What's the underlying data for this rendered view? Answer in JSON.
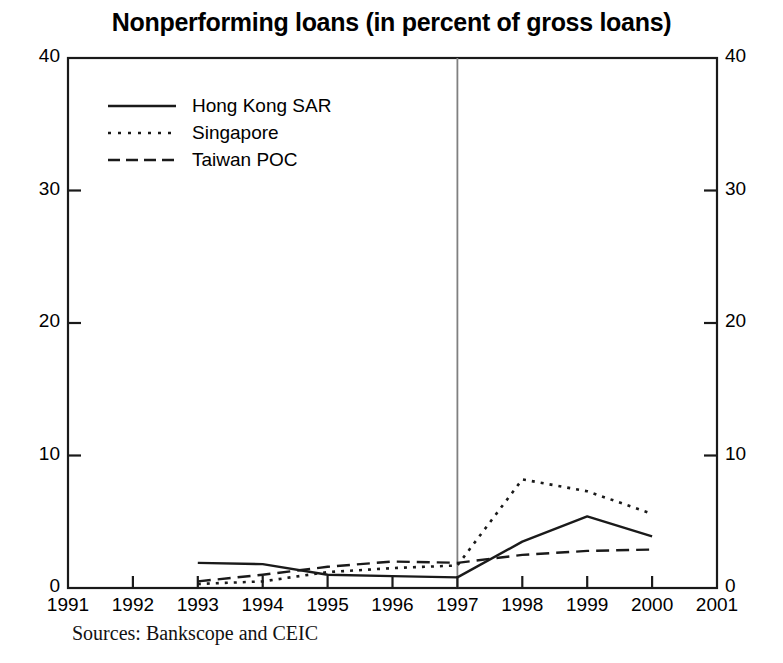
{
  "chart_data": {
    "type": "line",
    "title": "Nonperforming loans (in percent of gross loans)",
    "xlabel": "",
    "ylabel": "",
    "xlim": [
      1991,
      2001
    ],
    "ylim": [
      0,
      40
    ],
    "grid": false,
    "legend_position": "top-left",
    "x_tick_labels": [
      "1991",
      "1992",
      "1993",
      "1994",
      "1995",
      "1996",
      "1997",
      "1998",
      "1999",
      "2000",
      "2001"
    ],
    "y_tick_labels_left": [
      "0",
      "10",
      "20",
      "30",
      "40"
    ],
    "y_tick_labels_right": [
      "0",
      "10",
      "20",
      "30",
      "40"
    ],
    "y_ticks": [
      0,
      10,
      20,
      30,
      40
    ],
    "x": [
      1993,
      1994,
      1995,
      1996,
      1997,
      1998,
      1999,
      2000
    ],
    "annotations": [
      {
        "name": "crisis-divider",
        "type": "vline",
        "x": 1997,
        "color": "#808080"
      }
    ],
    "series": [
      {
        "name": "Hong Kong SAR",
        "style": "solid",
        "color": "#1a1a1a",
        "values": [
          1.9,
          1.8,
          1.0,
          0.9,
          0.8,
          3.5,
          5.4,
          3.9
        ]
      },
      {
        "name": "Singapore",
        "style": "dotted",
        "color": "#1a1a1a",
        "values": [
          0.3,
          0.5,
          1.2,
          1.5,
          1.7,
          8.2,
          7.3,
          5.6
        ]
      },
      {
        "name": "Taiwan POC",
        "style": "dashed",
        "color": "#1a1a1a",
        "values": [
          0.5,
          1.0,
          1.6,
          2.0,
          1.9,
          2.5,
          2.8,
          2.9
        ]
      }
    ]
  },
  "source_note": "Sources: Bankscope and CEIC"
}
